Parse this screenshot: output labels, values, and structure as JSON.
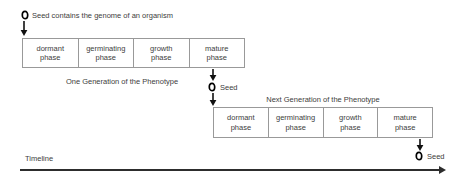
{
  "colors": {
    "background": "#ffffff",
    "box_border": "#999999",
    "text": "#3d3d3d",
    "arrow": "#111111",
    "timeline": "#2d2d2d"
  },
  "top_label": {
    "text": "Seed contains the genome of an organism"
  },
  "generation1": {
    "caption": "One Generation of the Phenotype",
    "phases": [
      {
        "line1": "dormant",
        "line2": "phase"
      },
      {
        "line1": "germinating",
        "line2": "phase"
      },
      {
        "line1": "growth",
        "line2": "phase"
      },
      {
        "line1": "mature",
        "line2": "phase"
      }
    ]
  },
  "seed_after_gen1": {
    "label": "Seed"
  },
  "generation2": {
    "caption": "Next Generation of the Phenotype",
    "phases": [
      {
        "line1": "dormant",
        "line2": "phase"
      },
      {
        "line1": "germinating",
        "line2": "phase"
      },
      {
        "line1": "growth",
        "line2": "phase"
      },
      {
        "line1": "mature",
        "line2": "phase"
      }
    ]
  },
  "seed_after_gen2": {
    "label": "Seed"
  },
  "timeline": {
    "label": "Timeline"
  }
}
